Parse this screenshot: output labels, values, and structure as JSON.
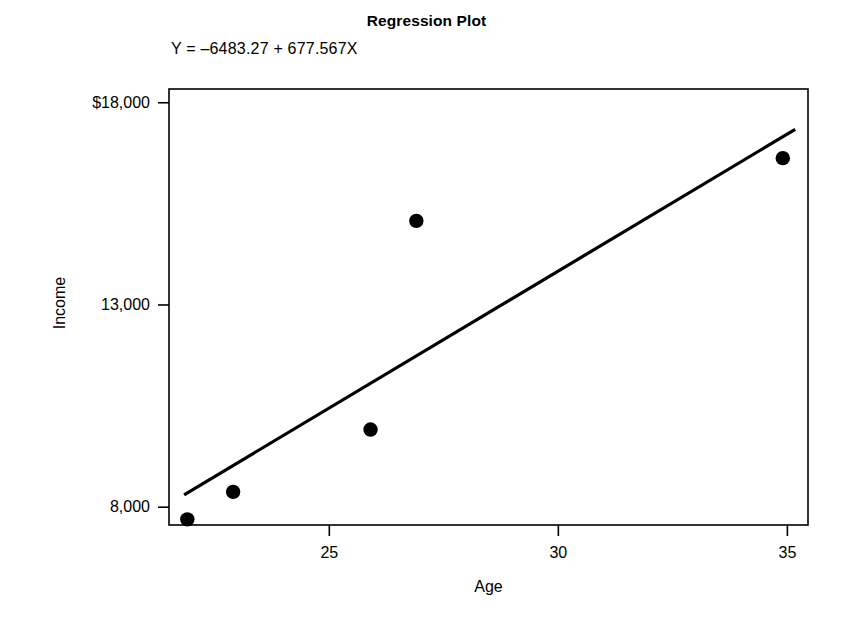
{
  "chart_data": {
    "type": "scatter",
    "title": "Regression Plot",
    "subtitle": "Y = –6483.27 + 677.567X",
    "xlabel": "Age",
    "ylabel": "Income",
    "xlim": [
      21.5,
      35.45
    ],
    "ylim": [
      7560,
      18340
    ],
    "grid": false,
    "legend": null,
    "xticks": [
      {
        "value": 25,
        "label": "25"
      },
      {
        "value": 30,
        "label": "30"
      },
      {
        "value": 35,
        "label": "35"
      }
    ],
    "yticks": [
      {
        "value": 18000,
        "label": "$18,000"
      },
      {
        "value": 13000,
        "label": "13,000"
      },
      {
        "value": 8000,
        "label": "8,000"
      }
    ],
    "series": [
      {
        "name": "Observations",
        "type": "scatter",
        "marker": "filled-circle",
        "color": "#000000",
        "points": [
          {
            "x": 21.9,
            "y": 7700
          },
          {
            "x": 22.9,
            "y": 8380
          },
          {
            "x": 25.9,
            "y": 9920
          },
          {
            "x": 26.9,
            "y": 15080
          },
          {
            "x": 34.9,
            "y": 16630
          }
        ]
      },
      {
        "name": "Least-squares regression line",
        "type": "line",
        "color": "#000000",
        "equation": "Y = -6483.27 + 677.567X",
        "intercept": -6483.27,
        "slope": 677.567,
        "endpoints": [
          {
            "x": 21.83,
            "y": 8307
          },
          {
            "x": 35.17,
            "y": 17342
          }
        ]
      }
    ]
  },
  "axes": {
    "frame_color": "#000000",
    "tick_color": "#000000"
  }
}
